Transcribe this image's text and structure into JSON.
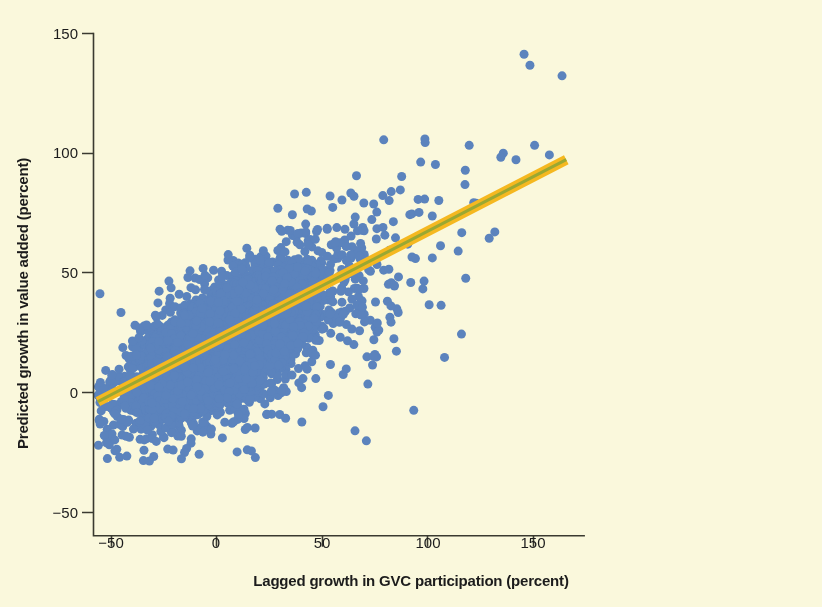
{
  "figure": {
    "background_color": "#faf8dc",
    "width": 822,
    "height": 607
  },
  "chart_data": {
    "type": "scatter",
    "title": "",
    "subtitle": "",
    "xlabel": "Lagged growth in GVC participation (percent)",
    "ylabel": "Predicted growth in value added (percent)",
    "xlim": [
      -62,
      172
    ],
    "ylim": [
      -60,
      158
    ],
    "xticks": [
      -50,
      0,
      50,
      100,
      150
    ],
    "xtick_labels": [
      "−50",
      "0",
      "50",
      "100",
      "150"
    ],
    "yticks": [
      150,
      100,
      50,
      0,
      -50
    ],
    "ytick_labels": [
      "150",
      "100",
      "50",
      "0",
      "−50"
    ],
    "grid": false,
    "legend": null,
    "colors": {
      "point": "#5b83bd",
      "point_core": "#4f79b6",
      "trend_line": "#9aa832",
      "confidence_band": "#f5b820",
      "axis": "#3a3a30",
      "text": "#1c1c1c",
      "background": "#faf8dc"
    },
    "series": [
      {
        "name": "Country-sector observations",
        "kind": "scatter",
        "marker": "circle",
        "marker_size_px": 9,
        "color": "#5b83bd",
        "approx_n": 3000,
        "description": "Dense elliptical cloud of country-sector observations; core saturates into a solid blue mass between roughly x=-30 to x=45 and y=-10 to y=60, with a positively sloped dispersion extending to x=165.",
        "cloud": {
          "core_x_range": [
            -32,
            48
          ],
          "core_y_range": [
            -12,
            62
          ],
          "x_range": [
            -56,
            165
          ],
          "y_range": [
            -27,
            141
          ],
          "slope": 0.44,
          "intercept": 18
        },
        "notable_points": [
          {
            "x": -55,
            "y": 41,
            "note": "isolated left outlier"
          },
          {
            "x": 146,
            "y": 141,
            "note": "top-right outlier"
          },
          {
            "x": 164,
            "y": 132,
            "note": "far-right outlier"
          },
          {
            "x": 120,
            "y": 103,
            "note": "upper right point"
          },
          {
            "x": 135,
            "y": 98,
            "note": "upper right point"
          },
          {
            "x": 151,
            "y": 103,
            "note": "upper right point"
          },
          {
            "x": 158,
            "y": 99,
            "note": "upper right point"
          },
          {
            "x": 97,
            "y": 96,
            "note": "upper cluster point"
          },
          {
            "x": 104,
            "y": 95,
            "note": "upper cluster point"
          },
          {
            "x": 88,
            "y": 90,
            "note": "upper cluster point"
          },
          {
            "x": -34,
            "y": -20,
            "note": "lower left point"
          },
          {
            "x": -8,
            "y": -26,
            "note": "lower edge point"
          },
          {
            "x": 10,
            "y": -25,
            "note": "lower edge point"
          }
        ]
      },
      {
        "name": "Fitted trend line",
        "kind": "line",
        "color": "#9aa832",
        "linewidth_px": 3,
        "endpoints": [
          {
            "x": -56,
            "y": -4
          },
          {
            "x": 166,
            "y": 97
          }
        ],
        "slope": 0.455,
        "intercept": 21.5
      },
      {
        "name": "Confidence band",
        "kind": "band",
        "color": "#f5b820",
        "half_width_px": 5,
        "description": "Orange confidence interval ribbon drawn around the fitted line across the full x range."
      }
    ]
  },
  "axes": {
    "x_title": "Lagged growth in GVC participation (percent)",
    "y_title": "Predicted growth in value added (percent)",
    "x_tick_labels": [
      "−50",
      "0",
      "50",
      "100",
      "150"
    ],
    "y_tick_labels": [
      "150",
      "100",
      "50",
      "0",
      "−50"
    ]
  }
}
